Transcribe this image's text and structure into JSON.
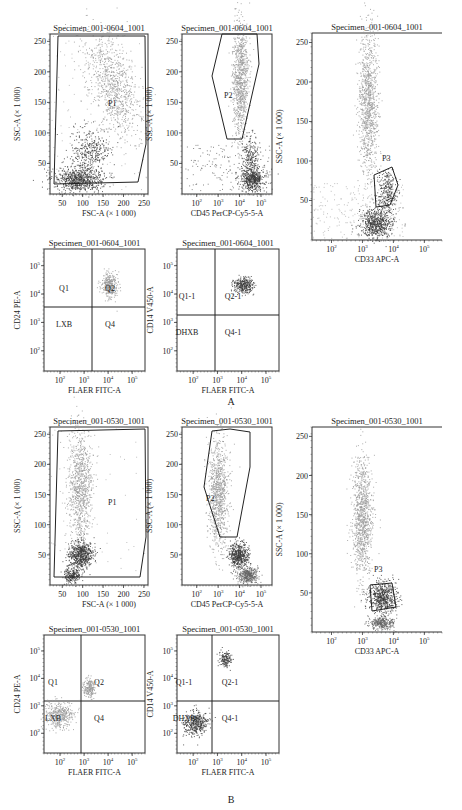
{
  "figure": {
    "panel_labels": [
      "A",
      "B"
    ],
    "colors": {
      "axis": "#333333",
      "population_light": "#9a9a9a",
      "population_dark": "#3a3a3a",
      "gate": "#222222"
    }
  },
  "chart_data": [
    {
      "panel": "A",
      "type": "scatter",
      "title": "Specimen_001-0604_1001",
      "xlabel": "FSC-A (× 1 000)",
      "ylabel": "SSC-A (× 1 000)",
      "xticks": [
        "50",
        "100",
        "150",
        "200",
        "250"
      ],
      "yticks": [
        "50",
        "100",
        "150",
        "200",
        "250"
      ],
      "xlim": [
        20,
        260
      ],
      "ylim": [
        0,
        262
      ],
      "gates": [
        "P1"
      ],
      "populations": [
        {
          "name": "granulocytes",
          "x_center": 140,
          "y_center": 170,
          "shade": "light"
        },
        {
          "name": "lymphocytes/monocytes",
          "x_center": 80,
          "y_center": 25,
          "shade": "dark"
        }
      ]
    },
    {
      "panel": "A",
      "type": "scatter",
      "title": "Specimen_001-0604_1001",
      "xlabel": "CD45 PerCP-Cy5-5-A",
      "ylabel": "SSC-A (× 1 000)",
      "xticks": [
        "10^2",
        "10^3",
        "10^4",
        "10^5"
      ],
      "yticks": [
        "50",
        "100",
        "150",
        "200",
        "250"
      ],
      "xscale": "log",
      "gates": [
        "P2"
      ],
      "populations": [
        {
          "name": "granulocytes",
          "x_center": "10^3.7",
          "y_center": 180,
          "shade": "light"
        },
        {
          "name": "lymphocytes",
          "x_center": "10^4.4",
          "y_center": 25,
          "shade": "dark"
        }
      ]
    },
    {
      "panel": "A",
      "type": "scatter",
      "title": "Specimen_001-0604_1001",
      "xlabel": "CD33 APC-A",
      "ylabel": "SSC-A (× 1 000)",
      "xticks": [
        "10^2",
        "10^3",
        "10^4",
        "10^5"
      ],
      "yticks": [
        "50",
        "100",
        "150",
        "200",
        "250"
      ],
      "xscale": "log",
      "gates": [
        "P3"
      ],
      "populations": [
        {
          "name": "granulocytes",
          "x_center": "10^3.1",
          "y_center": 160,
          "shade": "light"
        },
        {
          "name": "monocytes P3",
          "x_center": "10^3.5",
          "y_center": 55,
          "shade": "dark"
        }
      ]
    },
    {
      "panel": "A",
      "type": "scatter",
      "title": "Specimen_001-0604_1001",
      "xlabel": "FLAER FITC-A",
      "ylabel": "CD24 PE-A",
      "xticks": [
        "10^2",
        "10^3",
        "10^4",
        "10^5"
      ],
      "yticks": [
        "10^2",
        "10^3",
        "10^4",
        "10^5"
      ],
      "xscale": "log",
      "yscale": "log",
      "quadrants": [
        "Q1",
        "Q2",
        "LXB",
        "Q4"
      ],
      "populations": [
        {
          "name": "Q2",
          "x_center": "10^4.2",
          "y_center": "10^4.1",
          "shade": "light"
        }
      ]
    },
    {
      "panel": "A",
      "type": "scatter",
      "title": "Specimen_001-0604_1001",
      "xlabel": "FLAER FITC-A",
      "ylabel": "CD14 V450-A",
      "xticks": [
        "10^2",
        "10^3",
        "10^4",
        "10^5"
      ],
      "yticks": [
        "10^2",
        "10^3",
        "10^4",
        "10^5"
      ],
      "xscale": "log",
      "yscale": "log",
      "quadrants": [
        "Q1-1",
        "Q2-1",
        "DHXB",
        "Q4-1"
      ],
      "populations": [
        {
          "name": "Q2-1",
          "x_center": "10^4.1",
          "y_center": "10^4.2",
          "shade": "dark"
        }
      ]
    },
    {
      "panel": "B",
      "type": "scatter",
      "title": "Specimen_001-0530_1001",
      "xlabel": "FSC-A (× 1 000)",
      "ylabel": "SSC-A (× 1 000)",
      "xticks": [
        "50",
        "100",
        "150",
        "200",
        "250"
      ],
      "yticks": [
        "50",
        "100",
        "150",
        "200",
        "250"
      ],
      "gates": [
        "P1"
      ],
      "populations": [
        {
          "name": "granulocytes",
          "x_center": 85,
          "y_center": 140,
          "shade": "light"
        },
        {
          "name": "lymphocytes",
          "x_center": 80,
          "y_center": 40,
          "shade": "dark"
        }
      ]
    },
    {
      "panel": "B",
      "type": "scatter",
      "title": "Specimen_001-0530_1001",
      "xlabel": "CD45 PerCP-Cy5-5-A",
      "ylabel": "SSC-A (× 1 000)",
      "xticks": [
        "10^2",
        "10^3",
        "10^4",
        "10^5"
      ],
      "yticks": [
        "50",
        "100",
        "150",
        "200",
        "250"
      ],
      "xscale": "log",
      "gates": [
        "P2"
      ],
      "populations": [
        {
          "name": "granulocytes",
          "x_center": "10^3.3",
          "y_center": 140,
          "shade": "light"
        },
        {
          "name": "lymphocytes",
          "x_center": "10^3.8",
          "y_center": 40,
          "shade": "dark"
        }
      ]
    },
    {
      "panel": "B",
      "type": "scatter",
      "title": "Specimen_001-0530_1001",
      "xlabel": "CD33 APC-A",
      "ylabel": "SSC-A (× 1 000)",
      "xticks": [
        "10^2",
        "10^3",
        "10^4",
        "10^5"
      ],
      "yticks": [
        "50",
        "100",
        "150",
        "200",
        "250"
      ],
      "xscale": "log",
      "gates": [
        "P3"
      ],
      "populations": [
        {
          "name": "granulocytes",
          "x_center": "10^2.9",
          "y_center": 140,
          "shade": "light"
        },
        {
          "name": "P3",
          "x_center": "10^3.4",
          "y_center": 40,
          "shade": "dark"
        }
      ]
    },
    {
      "panel": "B",
      "type": "scatter",
      "title": "Specimen_001-0530_1001",
      "xlabel": "FLAER FITC-A",
      "ylabel": "CD24 PE-A",
      "xticks": [
        "10^2",
        "10^3",
        "10^4",
        "10^5"
      ],
      "yticks": [
        "10^2",
        "10^3",
        "10^4",
        "10^5"
      ],
      "xscale": "log",
      "yscale": "log",
      "quadrants": [
        "Q1",
        "Q2",
        "LXB",
        "Q4"
      ],
      "populations": [
        {
          "name": "Q2",
          "x_center": "10^3.4",
          "y_center": "10^3.8",
          "shade": "light"
        },
        {
          "name": "LXB",
          "x_center": "10^2.1",
          "y_center": "10^2.4",
          "shade": "light"
        }
      ]
    },
    {
      "panel": "B",
      "type": "scatter",
      "title": "Specimen_001-0530_1001",
      "xlabel": "FLAER FITC-A",
      "ylabel": "CD14 V450-A",
      "xticks": [
        "10^2",
        "10^3",
        "10^4",
        "10^5"
      ],
      "yticks": [
        "10^2",
        "10^3",
        "10^4",
        "10^5"
      ],
      "xscale": "log",
      "yscale": "log",
      "quadrants": [
        "Q1-1",
        "Q2-1",
        "DHXB",
        "Q4-1"
      ],
      "populations": [
        {
          "name": "Q2-1",
          "x_center": "10^3.4",
          "y_center": "10^4.3",
          "shade": "dark"
        },
        {
          "name": "DHXB",
          "x_center": "10^2.2",
          "y_center": "10^2.2",
          "shade": "dark"
        }
      ]
    }
  ]
}
